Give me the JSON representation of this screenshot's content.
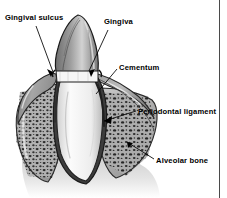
{
  "figure": {
    "style": "grayscale pen-and-ink anatomical illustration",
    "width": 227,
    "height": 198,
    "background_color": "#ffffff"
  },
  "labels": [
    {
      "id": "gingival-sulcus",
      "text": "Gingival sulcus",
      "x": 5,
      "y": 13,
      "leader": {
        "from_x": 36,
        "from_y": 26,
        "to_x": 54,
        "to_y": 74,
        "arrow": true
      }
    },
    {
      "id": "gingiva",
      "text": "Gingiva",
      "x": 104,
      "y": 17,
      "leader": {
        "from_x": 108,
        "from_y": 30,
        "to_x": 88,
        "to_y": 73,
        "arrow": true
      }
    },
    {
      "id": "cementum",
      "text": "Cementum",
      "x": 119,
      "y": 63,
      "leader": {
        "from_x": 117,
        "from_y": 69,
        "to_x": 96,
        "to_y": 94,
        "arrow": false
      }
    },
    {
      "id": "periodontal-ligament",
      "text": "Periodontal ligament",
      "x": 138,
      "y": 107,
      "leader": {
        "from_x": 136,
        "from_y": 111,
        "to_x": 104,
        "to_y": 121,
        "arrow": false
      }
    },
    {
      "id": "alveolar-bone",
      "text": "Alveolar bone",
      "x": 156,
      "y": 156,
      "leader": {
        "from_x": 154,
        "from_y": 159,
        "to_x": 127,
        "to_y": 142,
        "arrow": false
      }
    }
  ],
  "structures": [
    {
      "id": "crown",
      "name": "enamel crown",
      "tone": "#8f8f8f"
    },
    {
      "id": "gingiva-tissue",
      "name": "gingiva",
      "tone": "#9a9a9a"
    },
    {
      "id": "root",
      "name": "tooth root / dentin",
      "tone": "#f2f2f2"
    },
    {
      "id": "cementum-layer",
      "name": "cementum",
      "tone": "#5a5a5a"
    },
    {
      "id": "periodontal-ligament",
      "name": "periodontal ligament",
      "tone": "#3a3a3a"
    },
    {
      "id": "alveolar-bone-left",
      "name": "alveolar bone (left)",
      "tone": "#a8a8a8"
    },
    {
      "id": "alveolar-bone-right",
      "name": "alveolar bone (right)",
      "tone": "#a8a8a8"
    }
  ],
  "colors": {
    "ink": "#000000",
    "rule": "#4a4a4a",
    "crown_light": "#cfcfcf",
    "crown_dark": "#6b6b6b",
    "bone_fill": "#b4b4b4",
    "bone_stipple": "#1d1d1d",
    "root_fill": "#f4f4f4",
    "gum_fill": "#9e9e9e"
  },
  "border": {
    "right_rule_x": 219,
    "visible": true
  }
}
